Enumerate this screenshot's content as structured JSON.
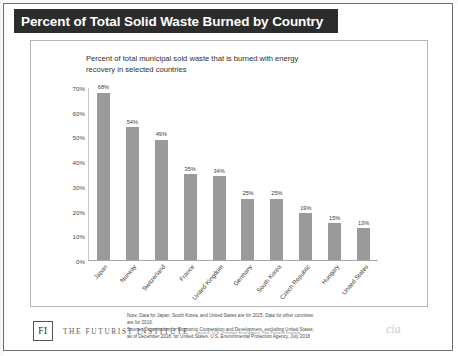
{
  "slide": {
    "title": "Percent of Total Solid Waste Burned by Country"
  },
  "chart_card": {
    "subtitle_line1": "Percent of total municipal sold waste that is burned with energy",
    "subtitle_line2": "recovery in selected countries",
    "notes": [
      "Note: Data for Japan, South Korea, and United States are for 2015. Data for other countries",
      "are for 2016.",
      "Source: Organization for Economic Cooperation and Development, excluding United States;",
      "as of December 2018; for United States, U.S. Environmental Protection Agency, July 2018",
      ""
    ],
    "watermark": "cia"
  },
  "footer": {
    "logo_text": "FI",
    "brand": "THE FUTURIST INSTITUTE",
    "source": "Source: U.S. Prestige Economics, The Futurist Institute"
  },
  "chart_data": {
    "type": "bar",
    "title": "Percent of total municipal sold waste that is burned with energy recovery in selected countries",
    "xlabel": "",
    "ylabel": "",
    "categories": [
      "Japan",
      "Norway",
      "Switzerland",
      "France",
      "United Kingdom",
      "Germany",
      "South Korea",
      "Czech Republic",
      "Hungary",
      "United States"
    ],
    "values": [
      68,
      54,
      49,
      35,
      34,
      25,
      25,
      19,
      15,
      13
    ],
    "value_labels": [
      "68%",
      "54%",
      "49%",
      "35%",
      "34%",
      "25%",
      "25%",
      "19%",
      "15%",
      "13%"
    ],
    "ylim": [
      0,
      70
    ],
    "ytick_labels": [
      "0%",
      "10%",
      "20%",
      "30%",
      "40%",
      "50%",
      "60%",
      "70%"
    ],
    "ytick_values": [
      0,
      10,
      20,
      30,
      40,
      50,
      60,
      70
    ],
    "grid": false,
    "legend": "none",
    "bar_color": "#9a9a9a"
  }
}
